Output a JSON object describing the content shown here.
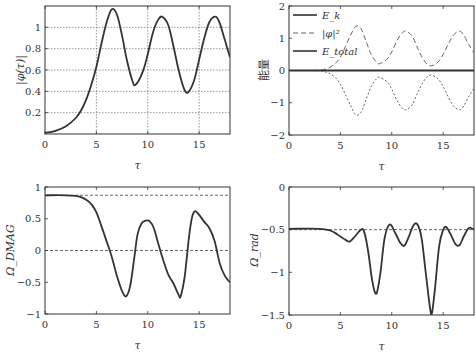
{
  "chart_data": [
    {
      "id": "phi-abs",
      "type": "line",
      "title": "",
      "xlabel": "τ",
      "ylabel": "|φ(τ)|",
      "xlim": [
        0,
        18
      ],
      "ylim": [
        0,
        1.2
      ],
      "xticks": [
        "0",
        "5",
        "10",
        "15"
      ],
      "yticks": [
        "0.2",
        "0.4",
        "0.6",
        "0.8",
        "1"
      ],
      "grid": true,
      "series": [
        {
          "name": "|φ(τ)|",
          "x": [
            0,
            1,
            2,
            3,
            3.5,
            4,
            4.5,
            5,
            5.5,
            6,
            6.5,
            7,
            7.5,
            8,
            8.5,
            8.8,
            9.5,
            10,
            10.5,
            11,
            11.4,
            12,
            12.5,
            13,
            13.5,
            13.9,
            14.5,
            15,
            15.5,
            16,
            16.6,
            17,
            17.5,
            18
          ],
          "y": [
            0.01,
            0.03,
            0.07,
            0.15,
            0.22,
            0.32,
            0.46,
            0.63,
            0.85,
            1.05,
            1.17,
            1.12,
            0.92,
            0.68,
            0.5,
            0.46,
            0.58,
            0.75,
            0.95,
            1.07,
            1.1,
            1.02,
            0.82,
            0.6,
            0.43,
            0.39,
            0.5,
            0.7,
            0.9,
            1.05,
            1.1,
            1.04,
            0.88,
            0.72
          ]
        }
      ]
    },
    {
      "id": "energy",
      "type": "line",
      "title": "",
      "xlabel": "τ",
      "ylabel": "能量",
      "xlim": [
        0,
        18
      ],
      "ylim": [
        -2,
        2
      ],
      "xticks": [
        "0",
        "5",
        "10",
        "15"
      ],
      "yticks": [
        "−2",
        "−1",
        "0",
        "1",
        "2"
      ],
      "grid": false,
      "legend": {
        "position": "upper left",
        "entries": [
          "E_k",
          "|φ|²",
          "E_total"
        ]
      },
      "series": [
        {
          "name": "E_k",
          "style": "dotted",
          "x": [
            0,
            1,
            2,
            3,
            3.5,
            4,
            4.5,
            5,
            5.5,
            6,
            6.5,
            7,
            7.5,
            8,
            8.5,
            8.8,
            9.5,
            10,
            10.5,
            11,
            11.4,
            12,
            12.5,
            13,
            13.5,
            13.9,
            14.5,
            15,
            15.5,
            16,
            16.6,
            17,
            17.5,
            18
          ],
          "y": [
            0,
            0,
            0,
            -0.01,
            -0.04,
            -0.1,
            -0.22,
            -0.42,
            -0.75,
            -1.1,
            -1.37,
            -1.3,
            -0.9,
            -0.5,
            -0.26,
            -0.21,
            -0.34,
            -0.58,
            -0.92,
            -1.16,
            -1.22,
            -1.06,
            -0.7,
            -0.38,
            -0.18,
            -0.15,
            -0.26,
            -0.5,
            -0.82,
            -1.1,
            -1.22,
            -1.1,
            -0.8,
            -0.55
          ]
        },
        {
          "name": "|φ|²",
          "style": "dashed",
          "x": [
            0,
            1,
            2,
            3,
            3.5,
            4,
            4.5,
            5,
            5.5,
            6,
            6.5,
            7,
            7.5,
            8,
            8.5,
            8.8,
            9.5,
            10,
            10.5,
            11,
            11.4,
            12,
            12.5,
            13,
            13.5,
            13.9,
            14.5,
            15,
            15.5,
            16,
            16.6,
            17,
            17.5,
            18
          ],
          "y": [
            0,
            0,
            0,
            0.01,
            0.04,
            0.1,
            0.22,
            0.42,
            0.75,
            1.1,
            1.37,
            1.3,
            0.9,
            0.5,
            0.26,
            0.21,
            0.34,
            0.58,
            0.92,
            1.16,
            1.22,
            1.06,
            0.7,
            0.38,
            0.18,
            0.15,
            0.26,
            0.5,
            0.82,
            1.1,
            1.22,
            1.1,
            0.8,
            0.55
          ]
        },
        {
          "name": "E_total",
          "style": "solid",
          "x": [
            0,
            18
          ],
          "y": [
            0,
            0
          ]
        }
      ]
    },
    {
      "id": "omega-dmag",
      "type": "line",
      "title": "",
      "xlabel": "τ",
      "ylabel": "Ω_DMAG",
      "xlim": [
        0,
        18
      ],
      "ylim": [
        -1,
        1
      ],
      "xticks": [
        "0",
        "5",
        "10",
        "15"
      ],
      "yticks": [
        "−1",
        "−0.5",
        "0",
        "0.5",
        "1"
      ],
      "grid": false,
      "reference_lines": [
        0.87,
        0
      ],
      "series": [
        {
          "name": "Ω_DMAG",
          "x": [
            0,
            2,
            3,
            3.5,
            4,
            4.5,
            5,
            5.5,
            6,
            6.5,
            7,
            7.5,
            7.9,
            8.3,
            8.7,
            9,
            9.4,
            9.8,
            10.2,
            10.6,
            11,
            11.5,
            12,
            12.5,
            13,
            13.2,
            13.6,
            14,
            14.3,
            14.6,
            15,
            15.5,
            16,
            16.5,
            17,
            17.5,
            18
          ],
          "y": [
            0.87,
            0.87,
            0.86,
            0.84,
            0.8,
            0.73,
            0.6,
            0.38,
            0.14,
            -0.1,
            -0.4,
            -0.64,
            -0.72,
            -0.55,
            -0.1,
            0.25,
            0.43,
            0.47,
            0.46,
            0.35,
            0.12,
            -0.15,
            -0.38,
            -0.52,
            -0.7,
            -0.72,
            -0.4,
            0.2,
            0.52,
            0.62,
            0.56,
            0.45,
            0.35,
            0.15,
            -0.2,
            -0.4,
            -0.5
          ]
        }
      ]
    },
    {
      "id": "omega-rad",
      "type": "line",
      "title": "",
      "xlabel": "τ",
      "ylabel": "Ω_rad",
      "xlim": [
        0,
        18
      ],
      "ylim": [
        -1.5,
        0
      ],
      "xticks": [
        "0",
        "5",
        "10",
        "15"
      ],
      "yticks": [
        "−1.5",
        "−1",
        "−0.5",
        "0"
      ],
      "grid": false,
      "reference_lines": [
        -0.5
      ],
      "series": [
        {
          "name": "Ω_rad",
          "x": [
            0,
            3,
            4,
            4.5,
            5,
            5.5,
            5.9,
            6.4,
            7,
            7.3,
            7.7,
            8.1,
            8.5,
            8.9,
            9.3,
            9.8,
            10.3,
            10.8,
            11.2,
            11.6,
            12.1,
            12.5,
            12.9,
            13.3,
            13.7,
            13.9,
            14.2,
            14.6,
            15,
            15.3,
            15.7,
            16.2,
            16.6,
            17,
            17.5,
            18
          ],
          "y": [
            -0.49,
            -0.49,
            -0.51,
            -0.54,
            -0.58,
            -0.62,
            -0.64,
            -0.58,
            -0.5,
            -0.52,
            -0.75,
            -1.1,
            -1.25,
            -1.0,
            -0.6,
            -0.44,
            -0.53,
            -0.65,
            -0.69,
            -0.6,
            -0.45,
            -0.44,
            -0.6,
            -1.0,
            -1.4,
            -1.48,
            -1.2,
            -0.7,
            -0.5,
            -0.47,
            -0.55,
            -0.67,
            -0.68,
            -0.58,
            -0.48,
            -0.5
          ]
        }
      ]
    }
  ]
}
